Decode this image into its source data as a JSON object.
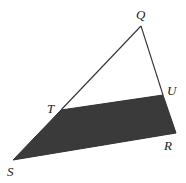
{
  "diagram": {
    "type": "geometry-triangle",
    "shade_color": "#3a3a3a",
    "line_color": "#333333",
    "points": {
      "Q": {
        "label": "Q",
        "x": 141,
        "y": 26
      },
      "U": {
        "label": "U",
        "x": 163,
        "y": 95
      },
      "R": {
        "label": "R",
        "x": 176,
        "y": 133
      },
      "T": {
        "label": "T",
        "x": 61,
        "y": 110
      },
      "S": {
        "label": "S",
        "x": 13,
        "y": 160
      }
    },
    "shaded_region": [
      "T",
      "U",
      "R",
      "S"
    ]
  }
}
